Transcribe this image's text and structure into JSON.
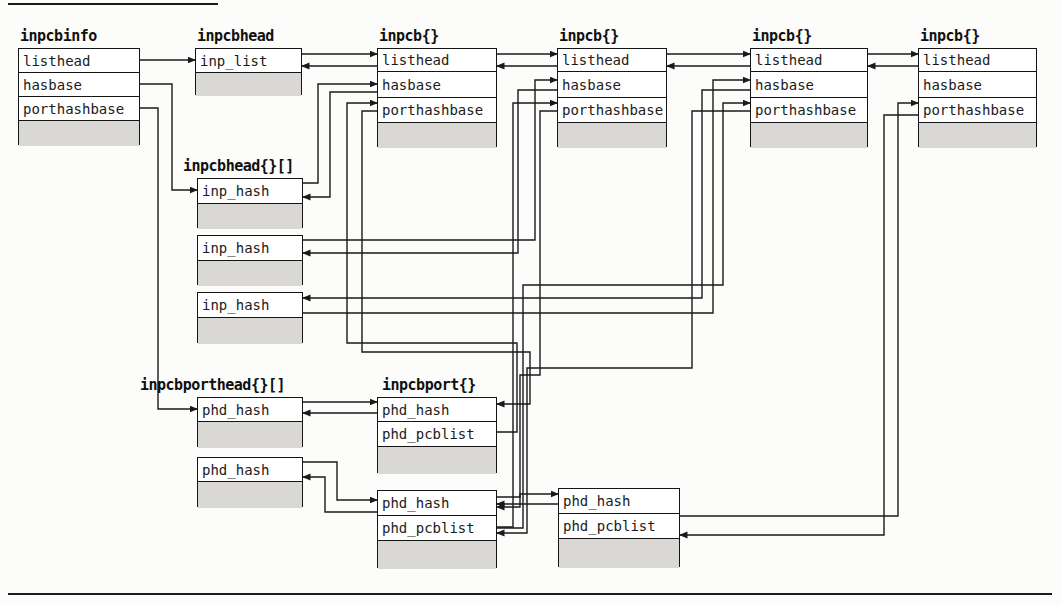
{
  "figure": {
    "kind": "data-structure pointer diagram",
    "shaded_row_meaning": "remainder of structure (not shown)"
  },
  "colors": {
    "background": "#fcfcfa",
    "line": "#1a1a1a",
    "box_fill": "#ffffff",
    "shaded_fill": "#d9d8d4",
    "text": "#1b1b1b"
  },
  "structures": [
    {
      "id": "inpcbinfo",
      "title": "inpcbinfo",
      "fields": [
        "listhead",
        "hasbase",
        "porthashbase"
      ],
      "shaded_row": true
    },
    {
      "id": "inpcbhead",
      "title": "inpcbhead",
      "fields": [
        "inp_list"
      ],
      "shaded_row": true
    },
    {
      "id": "inpcb1",
      "title": "inpcb{}",
      "fields": [
        "listhead",
        "hasbase",
        "porthashbase"
      ],
      "shaded_row": true
    },
    {
      "id": "inpcb2",
      "title": "inpcb{}",
      "fields": [
        "listhead",
        "hasbase",
        "porthashbase"
      ],
      "shaded_row": true
    },
    {
      "id": "inpcb3",
      "title": "inpcb{}",
      "fields": [
        "listhead",
        "hasbase",
        "porthashbase"
      ],
      "shaded_row": true
    },
    {
      "id": "inpcb4",
      "title": "inpcb{}",
      "fields": [
        "listhead",
        "hasbase",
        "porthashbase"
      ],
      "shaded_row": true
    },
    {
      "id": "hashbucket1",
      "title": "inpcbhead{}[]",
      "fields": [
        "inp_hash"
      ],
      "shaded_row": true
    },
    {
      "id": "hashbucket2",
      "title": "",
      "fields": [
        "inp_hash"
      ],
      "shaded_row": true
    },
    {
      "id": "hashbucket3",
      "title": "",
      "fields": [
        "inp_hash"
      ],
      "shaded_row": true
    },
    {
      "id": "portbucket1",
      "title": "inpcbporthead{}[]",
      "fields": [
        "phd_hash"
      ],
      "shaded_row": true
    },
    {
      "id": "portbucket2",
      "title": "",
      "fields": [
        "phd_hash"
      ],
      "shaded_row": true
    },
    {
      "id": "inpcbport1",
      "title": "inpcbport{}",
      "fields": [
        "phd_hash",
        "phd_pcblist"
      ],
      "shaded_row": true
    },
    {
      "id": "inpcbport2",
      "title": "",
      "fields": [
        "phd_hash",
        "phd_pcblist"
      ],
      "shaded_row": true
    },
    {
      "id": "inpcbport3",
      "title": "",
      "fields": [
        "phd_hash",
        "phd_pcblist"
      ],
      "shaded_row": true
    }
  ],
  "connections": [
    {
      "from": "inpcbinfo.listhead",
      "to": "inpcbhead.inp_list"
    },
    {
      "from": "inpcbhead.inp_list",
      "to": "inpcb1.listhead"
    },
    {
      "from": "inpcb1.listhead",
      "to": "inpcbhead.inp_list"
    },
    {
      "from": "inpcb1.listhead",
      "to": "inpcb2.listhead"
    },
    {
      "from": "inpcb2.listhead",
      "to": "inpcb1.listhead"
    },
    {
      "from": "inpcb2.listhead",
      "to": "inpcb3.listhead"
    },
    {
      "from": "inpcb3.listhead",
      "to": "inpcb2.listhead"
    },
    {
      "from": "inpcb3.listhead",
      "to": "inpcb4.listhead"
    },
    {
      "from": "inpcb4.listhead",
      "to": "inpcb3.listhead"
    },
    {
      "from": "inpcbinfo.hasbase",
      "to": "hashbucket1.inp_hash"
    },
    {
      "from": "inpcbinfo.porthashbase",
      "to": "portbucket1.phd_hash"
    },
    {
      "from": "hashbucket1.inp_hash",
      "to": "inpcb1.hasbase"
    },
    {
      "from": "inpcb1.hasbase",
      "to": "hashbucket1.inp_hash"
    },
    {
      "from": "hashbucket2.inp_hash",
      "to": "inpcb2.hasbase"
    },
    {
      "from": "inpcb2.hasbase",
      "to": "hashbucket2.inp_hash"
    },
    {
      "from": "hashbucket3.inp_hash",
      "to": "inpcb3.hasbase"
    },
    {
      "from": "inpcb3.hasbase",
      "to": "hashbucket3.inp_hash"
    },
    {
      "from": "inpcbport1.phd_pcblist",
      "to": "inpcb1.porthashbase"
    },
    {
      "from": "inpcb1.porthashbase",
      "to": "inpcbport1.phd_hash"
    },
    {
      "from": "inpcbport2.phd_pcblist",
      "to": "inpcb2.porthashbase"
    },
    {
      "from": "inpcb2.porthashbase",
      "to": "inpcbport2.phd_hash"
    },
    {
      "from": "inpcbport2.phd_pcblist",
      "to": "inpcb3.porthashbase"
    },
    {
      "from": "inpcb3.porthashbase",
      "to": "inpcbport2.phd_pcblist"
    },
    {
      "from": "portbucket1.phd_hash",
      "to": "inpcbport1.phd_hash"
    },
    {
      "from": "inpcbport1.phd_hash",
      "to": "portbucket1.phd_hash"
    },
    {
      "from": "portbucket2.phd_hash",
      "to": "inpcbport2.phd_hash"
    },
    {
      "from": "inpcbport2.phd_hash",
      "to": "portbucket2.phd_hash"
    },
    {
      "from": "inpcbport2.phd_hash",
      "to": "inpcbport3.phd_hash"
    },
    {
      "from": "inpcbport3.phd_hash",
      "to": "inpcbport2.phd_hash"
    },
    {
      "from": "inpcbport3.phd_pcblist",
      "to": "inpcb4.porthashbase"
    },
    {
      "from": "inpcb4.porthashbase",
      "to": "inpcbport3.phd_pcblist"
    }
  ]
}
